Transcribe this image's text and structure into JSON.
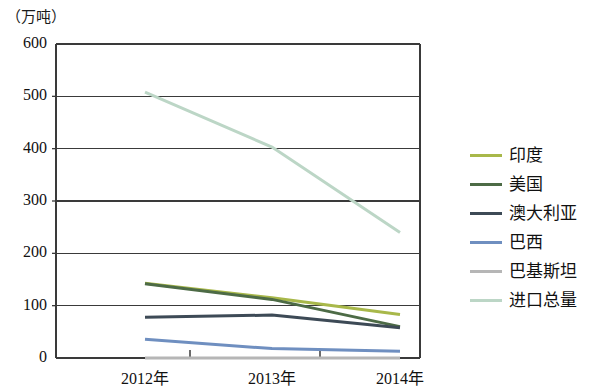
{
  "chart_data": {
    "type": "line",
    "title": "",
    "unit_label": "（万吨）",
    "xlabel": "",
    "ylabel": "",
    "x": [
      "2012年",
      "2013年",
      "2014年"
    ],
    "categories": [
      "2012年",
      "2013年",
      "2014年"
    ],
    "ylim": [
      0,
      600
    ],
    "yticks": [
      0,
      100,
      200,
      300,
      400,
      500,
      600
    ],
    "ytick_labels": [
      "0",
      "100",
      "200",
      "300",
      "400",
      "500",
      "600"
    ],
    "grid": true,
    "grid_axis": "y",
    "legend_position": "right",
    "series": [
      {
        "name": "印度",
        "values": [
          143,
          115,
          83
        ],
        "color": "#a8b84a"
      },
      {
        "name": "美国",
        "values": [
          142,
          112,
          60
        ],
        "color": "#4d6b46"
      },
      {
        "name": "澳大利亚",
        "values": [
          78,
          82,
          58
        ],
        "color": "#3d4a56"
      },
      {
        "name": "巴西",
        "values": [
          36,
          18,
          13
        ],
        "color": "#6f8fc0"
      },
      {
        "name": "巴基斯坦",
        "values": [
          0,
          0,
          0
        ],
        "color": "#b6b6b6"
      },
      {
        "name": "进口总量",
        "values": [
          508,
          403,
          240
        ],
        "color": "#bcd6c6"
      }
    ]
  },
  "axis": {
    "unit": "（万吨）",
    "y_labels": [
      "600",
      "500",
      "400",
      "300",
      "200",
      "100",
      "0"
    ],
    "x_labels": [
      "2012年",
      "2013年",
      "2014年"
    ]
  },
  "legend": {
    "items": [
      {
        "label": "印度",
        "color": "#a8b84a"
      },
      {
        "label": "美国",
        "color": "#4d6b46"
      },
      {
        "label": "澳大利亚",
        "color": "#3d4a56"
      },
      {
        "label": "巴西",
        "color": "#6f8fc0"
      },
      {
        "label": "巴基斯坦",
        "color": "#b6b6b6"
      },
      {
        "label": "进口总量",
        "color": "#bcd6c6"
      }
    ]
  }
}
